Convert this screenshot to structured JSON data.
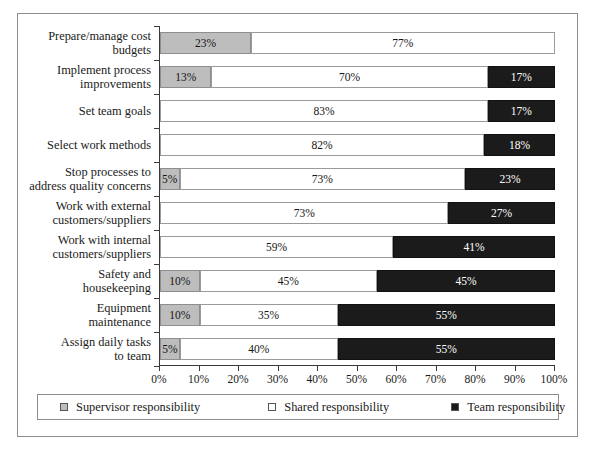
{
  "chart_data": {
    "type": "bar",
    "subtype": "horizontal-stacked-100",
    "title": "",
    "xlabel": "",
    "ylabel": "",
    "xlim": [
      0,
      100
    ],
    "grid": false,
    "legend_position": "bottom",
    "xticks": [
      "0%",
      "10%",
      "20%",
      "30%",
      "40%",
      "50%",
      "60%",
      "70%",
      "80%",
      "90%",
      "100%"
    ],
    "xtick_values": [
      0,
      10,
      20,
      30,
      40,
      50,
      60,
      70,
      80,
      90,
      100
    ],
    "categories": [
      "Prepare/manage cost budgets",
      "Implement process improvements",
      "Set team goals",
      "Select work methods",
      "Stop processes to address quality concerns",
      "Work with external customers/suppliers",
      "Work with internal customers/suppliers",
      "Safety and housekeeping",
      "Equipment maintenance",
      "Assign daily tasks to team"
    ],
    "series": [
      {
        "name": "Supervisor responsibility",
        "color": "#bdbdbd",
        "values": [
          23,
          13,
          0,
          0,
          5,
          0,
          0,
          10,
          10,
          5
        ]
      },
      {
        "name": "Shared responsibility",
        "color": "#ffffff",
        "values": [
          77,
          70,
          83,
          82,
          73,
          73,
          59,
          45,
          35,
          40
        ]
      },
      {
        "name": "Team responsibility",
        "color": "#1b1b1b",
        "values": [
          0,
          17,
          17,
          18,
          23,
          27,
          41,
          45,
          55,
          55
        ]
      }
    ]
  },
  "rows": [
    {
      "label_line1": "Prepare/manage cost",
      "label_line2": "budgets",
      "segments": [
        {
          "cls": "supervisor",
          "value": 23,
          "label": "23%"
        },
        {
          "cls": "shared",
          "value": 77,
          "label": "77%"
        }
      ]
    },
    {
      "label_line1": "Implement process",
      "label_line2": "improvements",
      "segments": [
        {
          "cls": "supervisor",
          "value": 13,
          "label": "13%"
        },
        {
          "cls": "shared",
          "value": 70,
          "label": "70%"
        },
        {
          "cls": "team",
          "value": 17,
          "label": "17%"
        }
      ]
    },
    {
      "label_line1": "Set team goals",
      "label_line2": "",
      "segments": [
        {
          "cls": "shared",
          "value": 83,
          "label": "83%"
        },
        {
          "cls": "team",
          "value": 17,
          "label": "17%"
        }
      ]
    },
    {
      "label_line1": "Select work methods",
      "label_line2": "",
      "segments": [
        {
          "cls": "shared",
          "value": 82,
          "label": "82%"
        },
        {
          "cls": "team",
          "value": 18,
          "label": "18%"
        }
      ]
    },
    {
      "label_line1": "Stop processes to",
      "label_line2": "address quality concerns",
      "segments": [
        {
          "cls": "supervisor",
          "value": 5,
          "label": "5%"
        },
        {
          "cls": "shared",
          "value": 73,
          "label": "73%"
        },
        {
          "cls": "team",
          "value": 23,
          "label": "23%"
        }
      ]
    },
    {
      "label_line1": "Work with external",
      "label_line2": "customers/suppliers",
      "segments": [
        {
          "cls": "shared",
          "value": 73,
          "label": "73%"
        },
        {
          "cls": "team",
          "value": 27,
          "label": "27%"
        }
      ]
    },
    {
      "label_line1": "Work with internal",
      "label_line2": "customers/suppliers",
      "segments": [
        {
          "cls": "shared",
          "value": 59,
          "label": "59%"
        },
        {
          "cls": "team",
          "value": 41,
          "label": "41%"
        }
      ]
    },
    {
      "label_line1": "Safety and",
      "label_line2": "housekeeping",
      "segments": [
        {
          "cls": "supervisor",
          "value": 10,
          "label": "10%"
        },
        {
          "cls": "shared",
          "value": 45,
          "label": "45%"
        },
        {
          "cls": "team",
          "value": 45,
          "label": "45%"
        }
      ]
    },
    {
      "label_line1": "Equipment",
      "label_line2": "maintenance",
      "segments": [
        {
          "cls": "supervisor",
          "value": 10,
          "label": "10%"
        },
        {
          "cls": "shared",
          "value": 35,
          "label": "35%"
        },
        {
          "cls": "team",
          "value": 55,
          "label": "55%"
        }
      ]
    },
    {
      "label_line1": "Assign daily tasks",
      "label_line2": "to team",
      "segments": [
        {
          "cls": "supervisor",
          "value": 5,
          "label": "5%"
        },
        {
          "cls": "shared",
          "value": 40,
          "label": "40%"
        },
        {
          "cls": "team",
          "value": 55,
          "label": "55%"
        }
      ]
    }
  ],
  "legend": {
    "items": [
      {
        "label": "Supervisor responsibility",
        "color": "#bdbdbd"
      },
      {
        "label": "Shared responsibility",
        "color": "#ffffff"
      },
      {
        "label": "Team responsibility",
        "color": "#1b1b1b"
      }
    ]
  }
}
